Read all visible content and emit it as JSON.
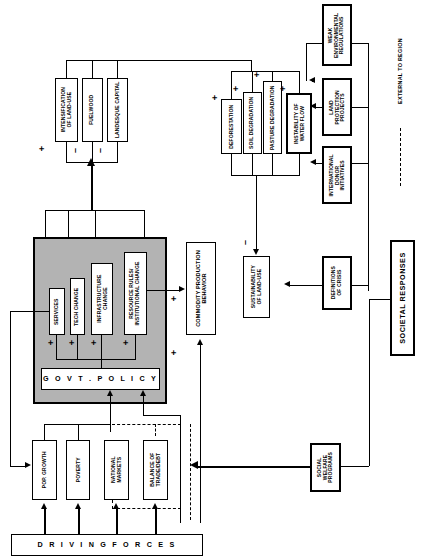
{
  "diagram": {
    "legend": {
      "external_label": "EXTERNAL TO REGION"
    },
    "group_labels": {
      "driving_forces": "D R I V I N G     F O R C E S",
      "societal_responses": "SOCIETAL RESPONSES"
    },
    "nodes": [
      {
        "id": "intensification",
        "label": "INTENSIFICATION\nOF LAND-USE"
      },
      {
        "id": "fuelwood",
        "label": "FUELWOOD"
      },
      {
        "id": "landesque",
        "label": "LANDESQUE CAPITAL"
      },
      {
        "id": "deforestation",
        "label": "DEFORESTATION"
      },
      {
        "id": "soil_degradation",
        "label": "SOIL DEGRADATION"
      },
      {
        "id": "pasture_degradation",
        "label": "PASTURE DEGRADATION"
      },
      {
        "id": "instability_water",
        "label": "INSTABILITY OF\nWATER FLOW"
      },
      {
        "id": "weak_env_regs",
        "label": "WEAK\nENVIRONMENTAL\nREGULATIONS"
      },
      {
        "id": "land_protection",
        "label": "LAND\nPROTECTION\nPROJECTS"
      },
      {
        "id": "intl_donor",
        "label": "INTERNATIONAL\nDONOR\nINITIATIVES"
      },
      {
        "id": "services",
        "label": "SERVICES"
      },
      {
        "id": "tech_change",
        "label": "TECH CHANGE"
      },
      {
        "id": "infrastructure",
        "label": "INFRASTRUCTURE\nCHANGE"
      },
      {
        "id": "resource_rules",
        "label": "RESOURCE RULES/\nINSTITUTIONAL CHANGE"
      },
      {
        "id": "govt_policy",
        "label": "G O V T .   P O L I C Y"
      },
      {
        "id": "commodity",
        "label": "COMMODITY PRODUCTION\nBEHAVIOR"
      },
      {
        "id": "sustainability",
        "label": "SUSTAINABILITY\nOF LAND-USE"
      },
      {
        "id": "definitions_crisis",
        "label": "DEFINITIONS\nOF CRISIS"
      },
      {
        "id": "pop_growth",
        "label": "POP. GROWTH"
      },
      {
        "id": "poverty",
        "label": "POVERTY"
      },
      {
        "id": "national_markets",
        "label": "NATIONAL\nMARKETS"
      },
      {
        "id": "balance_trade",
        "label": "BALANCE OF\nTRADE/DEBT"
      },
      {
        "id": "social_welfare",
        "label": "SOCIAL\nWELFARE\nPROGRAMS"
      }
    ],
    "signs": [
      {
        "id": "s1",
        "text": "+"
      },
      {
        "id": "s2",
        "text": "–"
      },
      {
        "id": "s3",
        "text": "–"
      },
      {
        "id": "s4",
        "text": "+"
      },
      {
        "id": "s5",
        "text": "+"
      },
      {
        "id": "s6",
        "text": "+"
      },
      {
        "id": "s7",
        "text": "+"
      },
      {
        "id": "s8",
        "text": "+"
      },
      {
        "id": "s9",
        "text": "+"
      },
      {
        "id": "s10",
        "text": "+"
      },
      {
        "id": "s11",
        "text": "+"
      },
      {
        "id": "s12",
        "text": "+"
      },
      {
        "id": "s13",
        "text": "+"
      },
      {
        "id": "s14",
        "text": "–"
      }
    ],
    "colors": {
      "panel": "#b3b3b3",
      "stroke": "#000000",
      "background": "#ffffff"
    }
  }
}
